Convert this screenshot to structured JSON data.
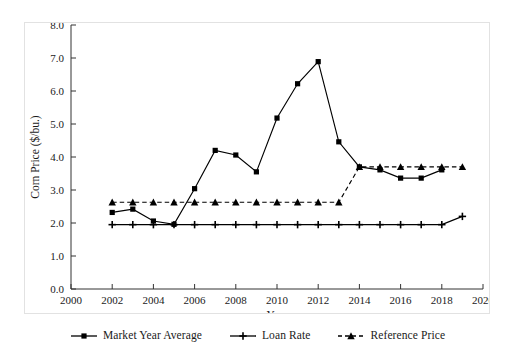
{
  "chart_data": {
    "type": "line",
    "title": "",
    "xlabel": "Year",
    "ylabel": "Corn Price ($/bu.)",
    "xlim": [
      2000,
      2020
    ],
    "ylim": [
      0.0,
      8.0
    ],
    "xticks": [
      2000,
      2002,
      2004,
      2006,
      2008,
      2010,
      2012,
      2014,
      2016,
      2018,
      2020
    ],
    "yticks": [
      "0.0",
      "1.0",
      "2.0",
      "3.0",
      "4.0",
      "5.0",
      "6.0",
      "7.0",
      "8.0"
    ],
    "grid": false,
    "legend_position": "bottom",
    "x": [
      2002,
      2003,
      2004,
      2005,
      2006,
      2007,
      2008,
      2009,
      2010,
      2011,
      2012,
      2013,
      2014,
      2015,
      2016,
      2017,
      2018,
      2019
    ],
    "series": [
      {
        "name": "Market Year Average",
        "marker": "square",
        "line": "solid",
        "color": "#000000",
        "values": [
          2.32,
          2.42,
          2.06,
          1.96,
          3.04,
          4.2,
          4.06,
          3.55,
          5.18,
          6.22,
          6.89,
          4.46,
          3.7,
          3.61,
          3.36,
          3.36,
          3.61,
          null
        ]
      },
      {
        "name": "Loan Rate",
        "marker": "plus",
        "line": "solid",
        "color": "#000000",
        "values": [
          1.95,
          1.95,
          1.95,
          1.95,
          1.95,
          1.95,
          1.95,
          1.95,
          1.95,
          1.95,
          1.95,
          1.95,
          1.95,
          1.95,
          1.95,
          1.95,
          1.95,
          2.2
        ]
      },
      {
        "name": "Reference Price",
        "marker": "triangle",
        "line": "dashed",
        "color": "#000000",
        "values": [
          2.63,
          2.63,
          2.63,
          2.63,
          2.63,
          2.63,
          2.63,
          2.63,
          2.63,
          2.63,
          2.63,
          2.63,
          3.7,
          3.7,
          3.7,
          3.7,
          3.7,
          3.7
        ]
      }
    ]
  },
  "legend": {
    "items": [
      {
        "label": "Market Year Average",
        "marker": "square",
        "line": "solid"
      },
      {
        "label": "Loan Rate",
        "marker": "plus",
        "line": "solid"
      },
      {
        "label": "Reference Price",
        "marker": "triangle",
        "line": "dashed"
      }
    ]
  }
}
